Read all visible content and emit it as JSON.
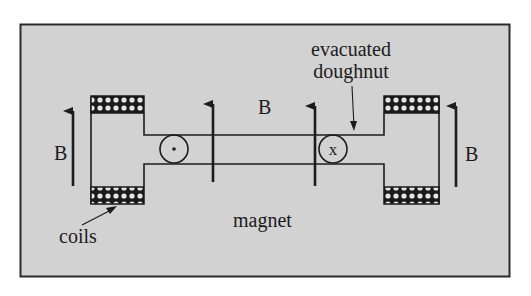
{
  "diagram": {
    "labels": {
      "field_left": "B",
      "field_center": "B",
      "field_right": "B",
      "doughnut_line1": "evacuated",
      "doughnut_line2": "doughnut",
      "coils": "coils",
      "magnet": "magnet"
    },
    "symbols": {
      "left_beam": "dot (out of page)",
      "right_beam": "x (into page)",
      "right_beam_glyph": "x"
    },
    "colors": {
      "background": "#d2d2d2",
      "frame": "#2a2a2a",
      "ink": "#1c1c1c",
      "coil": "#1a1a1a"
    }
  }
}
